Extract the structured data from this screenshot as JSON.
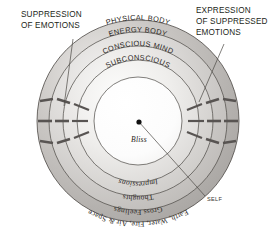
{
  "diagram": {
    "center": {
      "x": 138,
      "y": 121,
      "dot_label": "center-dot"
    },
    "outer_radius": 101,
    "callouts": [
      {
        "id": "suppression",
        "lines": [
          "SUPPRESSION",
          "OF EMOTIONS"
        ],
        "side": "left"
      },
      {
        "id": "expression",
        "lines": [
          "EXPRESSION",
          "OF SUPPRESSED",
          "EMOTIONS"
        ],
        "side": "right"
      }
    ],
    "self_label": "SELF",
    "rings": [
      {
        "id": "elements",
        "label": "Earth, Water, Fire, Air & Space",
        "radius": 101,
        "style": "serif-plain",
        "position": "bottom-arc"
      },
      {
        "id": "gross-feelings",
        "label": "Gross Feelings",
        "radius": 89,
        "style": "serif-plain",
        "position": "bottom-arc"
      },
      {
        "id": "thoughts",
        "label": "Thoughts",
        "radius": 75,
        "style": "serif-plain",
        "position": "bottom-arc"
      },
      {
        "id": "impressions",
        "label": "Impressions",
        "radius": 61,
        "style": "serif-italic",
        "position": "bottom-arc"
      },
      {
        "id": "bliss",
        "label": "Bliss",
        "radius": 44,
        "style": "serif-italic",
        "position": "center"
      },
      {
        "id": "subconscious",
        "label": "SUBCONSCIOUS",
        "radius": 61,
        "style": "sans-caps",
        "position": "top-arc"
      },
      {
        "id": "conscious-mind",
        "label": "CONSCIOUS MIND",
        "radius": 75,
        "style": "sans-caps",
        "position": "top-arc"
      },
      {
        "id": "energy-body",
        "label": "ENERGY BODY",
        "radius": 89,
        "style": "sans-caps",
        "position": "top-arc"
      },
      {
        "id": "physical-body",
        "label": "PHYSICAL BODY",
        "radius": 101,
        "style": "sans-caps",
        "position": "top-arc"
      }
    ],
    "colors": {
      "outer_ring_fill": "#b7b4b1",
      "ring2_fill": "#c9c7c4",
      "ring3_fill": "#d8d6d4",
      "ring4_fill": "#e6e5e3",
      "ring5_fill": "#f1f0ef",
      "core_fill": "#fafafa",
      "stroke": "#4b4744",
      "text": "#231f20",
      "tick": "#585452",
      "background": "#ffffff"
    },
    "tick_groups": [
      {
        "id": "left-ticks",
        "side": "left",
        "count": 9
      },
      {
        "id": "right-ticks",
        "side": "right",
        "count": 9
      }
    ]
  }
}
